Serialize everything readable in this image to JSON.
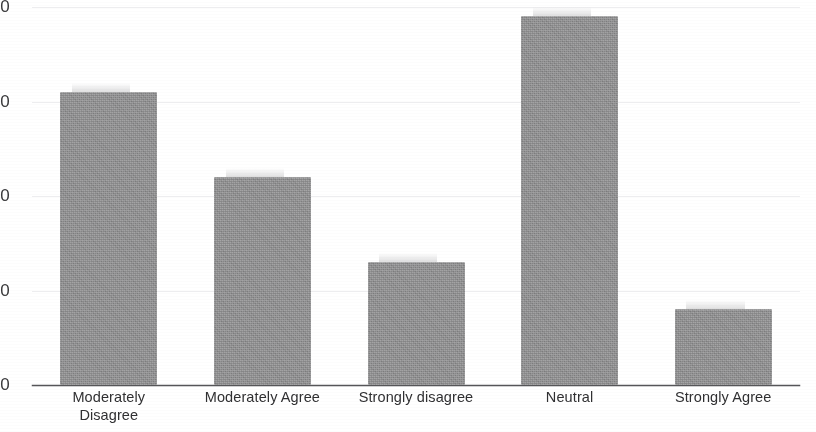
{
  "chart_data": {
    "type": "bar",
    "title": "",
    "subtitle": "",
    "xlabel": "",
    "ylabel": "",
    "categories": [
      "Moderately\nDisagree",
      "Moderately Agree",
      "Strongly disagree",
      "Neutral",
      "Strongly Agree"
    ],
    "values": [
      31,
      22,
      13,
      39,
      8
    ],
    "ylim": [
      0,
      40
    ],
    "yticks": [
      0,
      10,
      20,
      30,
      40
    ],
    "ytick_labels": [
      "0",
      "10",
      "20",
      "30",
      "40"
    ],
    "grid": true,
    "grid_axis": "y",
    "legend": false,
    "legend_position": "none",
    "bar_color": "#8d8d8e",
    "gridline_color": "#ededef",
    "axis_color": "#555558",
    "background_color": "#ffffff",
    "text_color": "#303032"
  }
}
